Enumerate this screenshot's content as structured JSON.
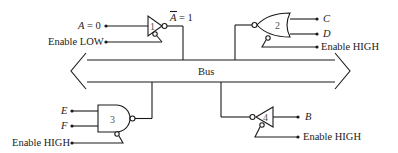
{
  "diagram": {
    "type": "three-state bus logic diagram",
    "bus": {
      "label": "Bus"
    },
    "gates": [
      {
        "id": "1",
        "type": "inverter (tri-state)",
        "input_label": "A = 0",
        "output_label": "Ā = 1",
        "enable_label": "Enable LOW",
        "connects_to": "bus"
      },
      {
        "id": "2",
        "type": "NOR (tri-state)",
        "input_labels": [
          "C",
          "D"
        ],
        "enable_label": "Enable HIGH",
        "connects_to": "bus"
      },
      {
        "id": "3",
        "type": "NAND (tri-state)",
        "input_labels": [
          "E",
          "F"
        ],
        "enable_label": "Enable HIGH",
        "connects_to": "bus"
      },
      {
        "id": "4",
        "type": "inverter (tri-state)",
        "output_label": "B",
        "enable_label": "Enable HIGH",
        "connects_to": "bus"
      }
    ]
  },
  "labels": {
    "a_input": "A = 0",
    "a_var": "A",
    "a_eq": " = 0",
    "a_out_var": "A",
    "a_out_eq": " = 1",
    "enable_low": "Enable LOW",
    "c": "C",
    "d": "D",
    "enable_high_2": "Enable HIGH",
    "bus": "Bus",
    "e": "E",
    "f": "F",
    "enable_high_3": "Enable HIGH",
    "b": "B",
    "enable_high_4": "Enable HIGH",
    "gate1": "1",
    "gate2": "2",
    "gate3": "3",
    "gate4": "4"
  }
}
